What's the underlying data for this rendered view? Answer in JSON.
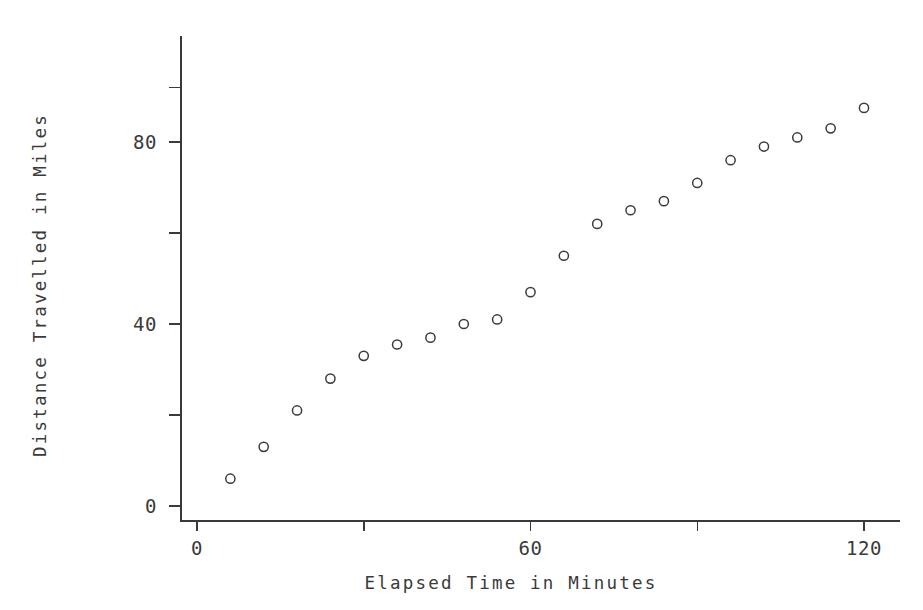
{
  "chart_data": {
    "type": "scatter",
    "title": "",
    "xlabel": "Elapsed Time in Minutes",
    "ylabel": "Distance Travelled in Miles",
    "xlim": [
      -3,
      123
    ],
    "ylim": [
      -3,
      94
    ],
    "grid": false,
    "legend": null,
    "marker": "open-circle",
    "marker_color": "#3c3c3c",
    "x_ticks": [
      0,
      30,
      60,
      90,
      120
    ],
    "x_tick_labels": [
      "0",
      "",
      "60",
      "",
      "120"
    ],
    "y_ticks": [
      0,
      20,
      40,
      60,
      80,
      92
    ],
    "y_tick_labels": [
      "0",
      "",
      "40",
      "",
      "80",
      ""
    ],
    "x": [
      6,
      12,
      18,
      24,
      30,
      36,
      42,
      48,
      54,
      60,
      66,
      72,
      78,
      84,
      90,
      96,
      102,
      108,
      114,
      120
    ],
    "y": [
      6,
      13,
      21,
      28,
      33,
      35.5,
      37,
      40,
      41,
      47,
      55,
      62,
      65,
      67,
      71,
      76,
      79,
      81,
      83,
      87.5
    ],
    "points": [
      {
        "x": 6,
        "y": 6
      },
      {
        "x": 12,
        "y": 13
      },
      {
        "x": 18,
        "y": 21
      },
      {
        "x": 24,
        "y": 28
      },
      {
        "x": 30,
        "y": 33
      },
      {
        "x": 36,
        "y": 35.5
      },
      {
        "x": 42,
        "y": 37
      },
      {
        "x": 48,
        "y": 40
      },
      {
        "x": 54,
        "y": 41
      },
      {
        "x": 60,
        "y": 47
      },
      {
        "x": 66,
        "y": 55
      },
      {
        "x": 72,
        "y": 62
      },
      {
        "x": 78,
        "y": 65
      },
      {
        "x": 84,
        "y": 67
      },
      {
        "x": 90,
        "y": 71
      },
      {
        "x": 96,
        "y": 76
      },
      {
        "x": 102,
        "y": 79
      },
      {
        "x": 108,
        "y": 81
      },
      {
        "x": 114,
        "y": 83
      },
      {
        "x": 120,
        "y": 87.5
      }
    ]
  },
  "axes": {
    "x_title": "Elapsed Time in Minutes",
    "y_title": "Distance Travelled in Miles",
    "x_labels": [
      {
        "value": 0,
        "text": "0"
      },
      {
        "value": 60,
        "text": "60"
      },
      {
        "value": 120,
        "text": "120"
      }
    ],
    "y_labels": [
      {
        "value": 0,
        "text": "0"
      },
      {
        "value": 40,
        "text": "40"
      },
      {
        "value": 80,
        "text": "80"
      }
    ]
  },
  "style": {
    "background": "#ffffff",
    "ink": "#3a3a3a"
  }
}
